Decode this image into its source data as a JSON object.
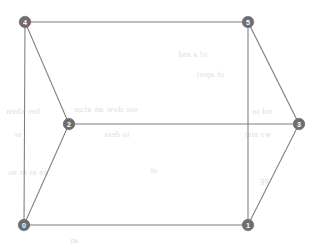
{
  "figure": {
    "kind": "undirected-graph-drawing",
    "width": 315,
    "height": 246,
    "background_color": "#ffffff",
    "node_fill_color": "#6d6d6d",
    "node_label_color": "#ffffff",
    "edge_color": "#7d7d7d",
    "node_radius": 5.8,
    "edge_width": 1.05
  },
  "graph": {
    "node_count": 6,
    "edge_count": 9,
    "nodes": [
      {
        "id": "0",
        "label": "0",
        "x": 24,
        "y": 225
      },
      {
        "id": "1",
        "label": "1",
        "x": 248,
        "y": 225
      },
      {
        "id": "2",
        "label": "2",
        "x": 69,
        "y": 124
      },
      {
        "id": "3",
        "label": "3",
        "x": 299,
        "y": 124
      },
      {
        "id": "4",
        "label": "4",
        "x": 25,
        "y": 22
      },
      {
        "id": "5",
        "label": "5",
        "x": 248,
        "y": 22
      }
    ],
    "edges": [
      {
        "source": "4",
        "target": "5",
        "x1": 25,
        "y1": 22,
        "x2": 248,
        "y2": 22
      },
      {
        "source": "4",
        "target": "0",
        "x1": 25,
        "y1": 22,
        "x2": 24,
        "y2": 225
      },
      {
        "source": "4",
        "target": "2",
        "x1": 25,
        "y1": 22,
        "x2": 69,
        "y2": 124
      },
      {
        "source": "2",
        "target": "3",
        "x1": 69,
        "y1": 124,
        "x2": 299,
        "y2": 124
      },
      {
        "source": "2",
        "target": "0",
        "x1": 69,
        "y1": 124,
        "x2": 24,
        "y2": 225
      },
      {
        "source": "5",
        "target": "1",
        "x1": 248,
        "y1": 22,
        "x2": 248,
        "y2": 225
      },
      {
        "source": "5",
        "target": "3",
        "x1": 248,
        "y1": 22,
        "x2": 299,
        "y2": 124
      },
      {
        "source": "3",
        "target": "1",
        "x1": 299,
        "y1": 124,
        "x2": 248,
        "y2": 225
      },
      {
        "source": "0",
        "target": "1",
        "x1": 24,
        "y1": 225,
        "x2": 248,
        "y2": 225
      }
    ]
  },
  "background_bleed": {
    "note": "faint reverse-side show-through marks, illegible",
    "marks": [
      {
        "text": "of a  and",
        "x": 178,
        "y": 50,
        "size": 8
      },
      {
        "text": "in aport",
        "x": 196,
        "y": 70,
        "size": 8
      },
      {
        "text": "ber shen",
        "x": 6,
        "y": 106,
        "size": 9
      },
      {
        "text": "sor dow  an  afon",
        "x": 74,
        "y": 104,
        "size": 9
      },
      {
        "text": "nd  ta",
        "x": 252,
        "y": 106,
        "size": 9
      },
      {
        "text": "or",
        "x": 14,
        "y": 130,
        "size": 8
      },
      {
        "text": "to  deas",
        "x": 104,
        "y": 130,
        "size": 8
      },
      {
        "text": "wo  mer",
        "x": 244,
        "y": 130,
        "size": 8
      },
      {
        "text": "on  as  or  no",
        "x": 8,
        "y": 168,
        "size": 8
      },
      {
        "text": "ot",
        "x": 150,
        "y": 166,
        "size": 8
      },
      {
        "text": "ng",
        "x": 260,
        "y": 176,
        "size": 8
      },
      {
        "text": "an",
        "x": 70,
        "y": 236,
        "size": 8
      }
    ]
  }
}
